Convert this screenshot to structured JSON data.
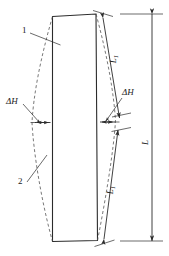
{
  "figure": {
    "type": "engineering-line-drawing",
    "colors": {
      "outline": "#2b2b2b",
      "dashed": "#555555",
      "dimension": "#2b2b2b",
      "text": "#1a1a1a",
      "background": "#ffffff"
    }
  },
  "labels": {
    "delta_h_left": "ΔH",
    "delta_h_right": "ΔH",
    "callout_1": "1",
    "callout_2": "2",
    "length_upper": "L",
    "length_upper_sub": "1",
    "length_lower": "L",
    "length_lower_sub": "1",
    "length_total": "L"
  },
  "elements": {
    "plate": "rectangular-plate-outline",
    "curve_left": "dashed-deformation-curve-left",
    "curve_right": "dashed-deformation-curve-right",
    "dim_upper": "slanted-dimension-line-upper",
    "dim_lower": "slanted-dimension-line-lower",
    "dim_total": "vertical-dimension-line-total",
    "dim_delta_left": "horizontal-dimension-arrow-left",
    "dim_delta_right": "horizontal-dimension-arrow-right",
    "leader_1": "leader-line-callout-1",
    "leader_2": "leader-line-callout-2",
    "leader_dh_left": "leader-line-delta-h-left",
    "leader_dh_right": "leader-line-delta-h-right"
  }
}
